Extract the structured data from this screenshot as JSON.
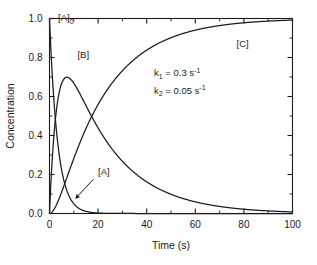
{
  "chart_data": {
    "type": "line",
    "title": "",
    "xlabel": "Time (s)",
    "ylabel": "Concentration",
    "xlim": [
      0,
      100
    ],
    "ylim": [
      0,
      1.0
    ],
    "xticks": [
      0,
      20,
      40,
      60,
      80,
      100
    ],
    "xticklabels": [
      "0",
      "20",
      "40",
      "60",
      "80",
      "100"
    ],
    "xminorticks": [
      10,
      30,
      50,
      70,
      90
    ],
    "yticks": [
      0.0,
      0.2,
      0.4,
      0.6,
      0.8,
      1.0
    ],
    "yticklabels": [
      "0.0",
      "0.2",
      "0.4",
      "0.6",
      "0.8",
      "1.0"
    ],
    "yminorticks": [
      0.1,
      0.3,
      0.5,
      0.7,
      0.9
    ],
    "grid": false,
    "legend": "none",
    "model": "consecutive-first-order",
    "k1": 0.3,
    "k2": 0.05,
    "A0": 1.0,
    "series": [
      {
        "name": "[A]",
        "label": "[A]",
        "formula": "A0*exp(-k1*t)",
        "x": [
          0,
          2,
          4,
          6,
          8,
          10,
          12,
          14,
          16,
          18,
          20,
          25,
          30,
          40,
          50,
          60,
          80,
          100
        ],
        "values": [
          1.0,
          0.549,
          0.301,
          0.165,
          0.091,
          0.05,
          0.027,
          0.015,
          0.008,
          0.0045,
          0.0025,
          0.00055,
          0.00012,
          0.0,
          0.0,
          0.0,
          0.0,
          0.0
        ]
      },
      {
        "name": "[B]",
        "label": "[B]",
        "formula": "A0*k1/(k2-k1)*(exp(-k1*t)-exp(-k2*t))",
        "x": [
          0,
          2,
          4,
          6,
          7.17,
          8,
          10,
          12,
          14,
          16,
          18,
          20,
          25,
          30,
          40,
          50,
          60,
          80,
          100
        ],
        "values": [
          0.0,
          0.537,
          0.684,
          0.699,
          0.698,
          0.692,
          0.655,
          0.607,
          0.555,
          0.503,
          0.453,
          0.406,
          0.304,
          0.223,
          0.12,
          0.065,
          0.035,
          0.01,
          0.003
        ]
      },
      {
        "name": "[C]",
        "label": "[C]",
        "formula": "A0*(1 + (k2*exp(-k1*t) - k1*exp(-k2*t))/(k1-k2))",
        "x": [
          0,
          2,
          4,
          6,
          8,
          10,
          12,
          14,
          16,
          18,
          20,
          25,
          30,
          40,
          50,
          60,
          80,
          100
        ],
        "values": [
          0.0,
          0.085,
          0.181,
          0.277,
          0.368,
          0.452,
          0.527,
          0.593,
          0.65,
          0.699,
          0.74,
          0.818,
          0.872,
          0.938,
          0.97,
          0.985,
          0.996,
          0.999
        ]
      }
    ],
    "annotations": [
      {
        "id": "A0-label",
        "text": "[A]",
        "subscript": "0",
        "x": 3.5,
        "y": 0.985
      },
      {
        "id": "B-label",
        "text": "[B]",
        "x": 11.5,
        "y": 0.795
      },
      {
        "id": "C-label",
        "text": "[C]",
        "x": 77.0,
        "y": 0.855
      },
      {
        "id": "A-label",
        "text": "[A]",
        "x": 20.0,
        "y": 0.195
      },
      {
        "id": "k1-annotation",
        "base": "k",
        "sub": "1",
        "rest": " = 0.3 s",
        "sup": "-1",
        "x": 43.0,
        "y": 0.705
      },
      {
        "id": "k2-annotation",
        "base": "k",
        "sub": "2",
        "rest": " = 0.05 s",
        "sup": "-1",
        "x": 43.0,
        "y": 0.615
      }
    ],
    "arrow": {
      "id": "A-pointer",
      "from": {
        "x": 18.0,
        "y": 0.175
      },
      "to": {
        "x": 10.6,
        "y": 0.075
      }
    },
    "colors": {
      "ink": "#1a1a1a",
      "background": "#ffffff"
    }
  }
}
